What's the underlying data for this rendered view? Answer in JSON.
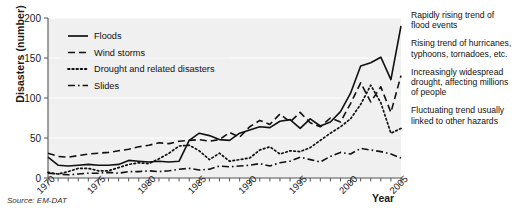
{
  "chart_data": {
    "type": "line",
    "title": "",
    "xlabel": "Year",
    "ylabel": "Disasters (number)",
    "xlim": [
      1970,
      2005
    ],
    "ylim": [
      0,
      200
    ],
    "yticks": [
      0,
      50,
      100,
      150,
      200
    ],
    "xticks": [
      1970,
      1975,
      1980,
      1985,
      1990,
      1995,
      2000,
      2005
    ],
    "xtick_labels": [
      "1970",
      "1975",
      "1980",
      "1985",
      "1990",
      "1995",
      "2000",
      "2005"
    ],
    "ytick_labels": [
      "0",
      "50",
      "100",
      "150",
      "200"
    ],
    "grid": true,
    "legend_position": "top-left",
    "x": [
      1970,
      1971,
      1972,
      1973,
      1974,
      1975,
      1976,
      1977,
      1978,
      1979,
      1980,
      1981,
      1982,
      1983,
      1984,
      1985,
      1986,
      1987,
      1988,
      1989,
      1990,
      1991,
      1992,
      1993,
      1994,
      1995,
      1996,
      1997,
      1998,
      1999,
      2000,
      2001,
      2002,
      2003,
      2004,
      2005
    ],
    "series": [
      {
        "name": "Floods",
        "style": "solid",
        "values": [
          26,
          16,
          15,
          16,
          17,
          16,
          16,
          17,
          22,
          21,
          20,
          21,
          20,
          21,
          47,
          56,
          53,
          48,
          47,
          56,
          60,
          64,
          63,
          71,
          73,
          62,
          74,
          65,
          70,
          83,
          106,
          140,
          144,
          151,
          123,
          190
        ]
      },
      {
        "name": "Wind storms",
        "style": "dashed",
        "values": [
          31,
          27,
          26,
          28,
          30,
          31,
          32,
          34,
          36,
          39,
          41,
          44,
          43,
          46,
          47,
          48,
          46,
          48,
          57,
          51,
          64,
          72,
          67,
          80,
          70,
          82,
          69,
          64,
          75,
          70,
          93,
          119,
          95,
          114,
          82,
          128
        ]
      },
      {
        "name": "Drought and related disasters",
        "style": "dotted",
        "values": [
          7,
          5,
          8,
          12,
          12,
          9,
          9,
          13,
          17,
          19,
          18,
          24,
          31,
          40,
          41,
          34,
          23,
          31,
          21,
          23,
          25,
          35,
          39,
          30,
          34,
          33,
          38,
          47,
          56,
          64,
          74,
          92,
          116,
          94,
          56,
          62
        ]
      },
      {
        "name": "Slides",
        "style": "dashdot",
        "values": [
          6,
          5,
          4,
          5,
          6,
          6,
          7,
          6,
          8,
          8,
          9,
          8,
          9,
          11,
          12,
          10,
          11,
          15,
          14,
          15,
          16,
          18,
          15,
          19,
          21,
          26,
          23,
          20,
          27,
          32,
          30,
          37,
          35,
          33,
          30,
          25
        ]
      }
    ]
  },
  "annotations": [
    "Rapidly rising trend of flood events",
    "Rising trend of hurricanes, typhoons, tornadoes, etc.",
    "Increasingly widespread drought, affecting millions of people",
    "Fluctuating trend usually linked to other hazards"
  ],
  "source": "Source: EM-DAT",
  "colors": {
    "line": "#111111",
    "plot_background": "#f0f0f0",
    "gridline": "#ffffff",
    "axis": "#555555",
    "text": "#1a1a1a"
  }
}
